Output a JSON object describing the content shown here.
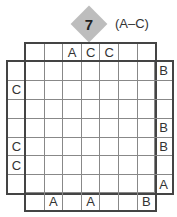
{
  "puzzle": {
    "number": "7",
    "letter_range": "(A–C)",
    "grid_size": 7,
    "clues": {
      "top": [
        "",
        "",
        "A",
        "C",
        "C",
        "",
        ""
      ],
      "bottom": [
        "",
        "A",
        "",
        "A",
        "",
        "",
        "B"
      ],
      "left": [
        "",
        "C",
        "",
        "",
        "C",
        "C",
        ""
      ],
      "right": [
        "B",
        "",
        "",
        "B",
        "B",
        "",
        "A"
      ]
    }
  }
}
